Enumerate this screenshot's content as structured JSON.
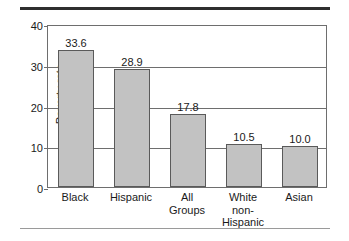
{
  "chart_data": {
    "type": "bar",
    "title": "",
    "subtitle": "",
    "xlabel": "",
    "ylabel": "Poverty rate",
    "ylim": [
      0,
      40
    ],
    "ytick_labels": [
      "0",
      "10",
      "20",
      "30",
      "40"
    ],
    "ytick_values": [
      0,
      10,
      20,
      30,
      40
    ],
    "grid": "horizontal",
    "legend": "none",
    "categories": [
      "Black",
      "Hispanic",
      "All Groups",
      "White non-Hispanic",
      "Asian"
    ],
    "category_lines": [
      [
        "Black"
      ],
      [
        "Hispanic"
      ],
      [
        "All",
        "Groups"
      ],
      [
        "White",
        "non-",
        "Hispanic"
      ],
      [
        "Asian"
      ]
    ],
    "values": [
      33.6,
      28.9,
      17.8,
      10.5,
      10.0
    ],
    "value_labels": [
      "33.6",
      "28.9",
      "17.8",
      "10.5",
      "10.0"
    ],
    "colors": {
      "bar_fill": "#c2c2c2",
      "bar_border": "#5a5a5a",
      "frame": "#6e6e6e",
      "grid": "#6e6e6e",
      "text": "#1a1a1a",
      "rule_top": "#2e2e2e",
      "rule_bottom": "#9a9a9a",
      "background": "#ffffff"
    }
  }
}
